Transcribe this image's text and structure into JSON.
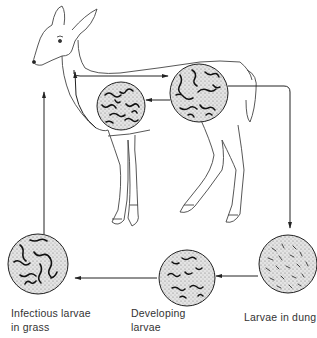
{
  "diagram": {
    "stages": [
      {
        "id": "infectious",
        "label": "Infectious larvae\nin grass"
      },
      {
        "id": "developing",
        "label": "Developing\nlarvae"
      },
      {
        "id": "dung",
        "label": "Larvae in dung"
      }
    ],
    "internal_stages": [
      {
        "id": "lungs",
        "description": "Worms in lungs (chest)"
      },
      {
        "id": "gut",
        "description": "Worms in abdomen"
      }
    ],
    "colors": {
      "ink": "#222222",
      "fill": "#d8d8d8",
      "background": "#ffffff"
    }
  }
}
